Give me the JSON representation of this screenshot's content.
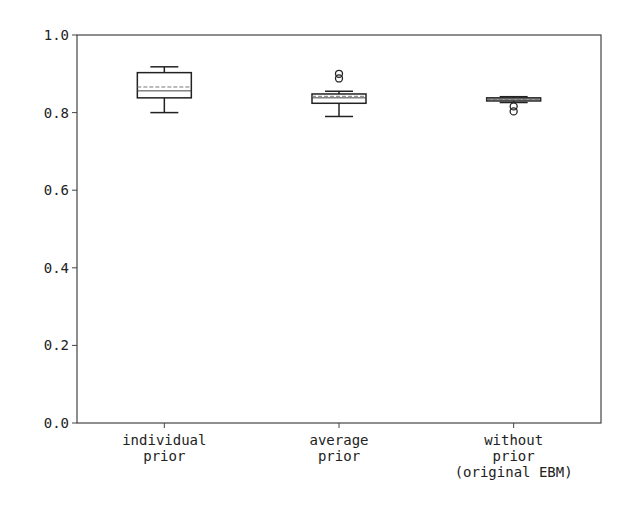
{
  "chart_data": {
    "type": "box",
    "title": "",
    "xlabel": "",
    "ylabel": "",
    "ylim": [
      0.0,
      1.0
    ],
    "yticks": [
      "0.0",
      "0.2",
      "0.4",
      "0.6",
      "0.8",
      "1.0"
    ],
    "grid": false,
    "categories": [
      [
        "individual",
        "prior"
      ],
      [
        "average",
        "prior"
      ],
      [
        "without",
        "prior",
        "(original EBM)"
      ]
    ],
    "series": [
      {
        "name": "individual prior",
        "whisker_low": 0.8,
        "q1": 0.838,
        "median": 0.856,
        "mean": 0.866,
        "q3": 0.903,
        "whisker_high": 0.918,
        "outliers": []
      },
      {
        "name": "average prior",
        "whisker_low": 0.79,
        "q1": 0.824,
        "median": 0.838,
        "mean": 0.842,
        "q3": 0.848,
        "whisker_high": 0.855,
        "outliers": [
          0.888,
          0.9
        ]
      },
      {
        "name": "without prior (original EBM)",
        "whisker_low": 0.826,
        "q1": 0.83,
        "median": 0.835,
        "mean": 0.834,
        "q3": 0.838,
        "whisker_high": 0.841,
        "outliers": [
          0.816,
          0.803
        ]
      }
    ]
  }
}
